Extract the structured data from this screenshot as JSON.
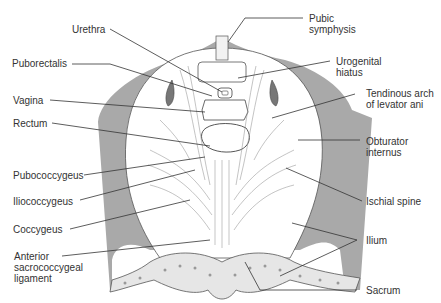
{
  "diagram": {
    "colors": {
      "bone": "#a9a9a9",
      "line": "#333333",
      "muscle_fill": "#ffffff",
      "sacrum_fill": "#e6e6e6"
    },
    "labels_left": [
      {
        "id": "urethra",
        "text": "Urethra"
      },
      {
        "id": "puborectalis",
        "text": "Puborectalis"
      },
      {
        "id": "vagina",
        "text": "Vagina"
      },
      {
        "id": "rectum",
        "text": "Rectum"
      },
      {
        "id": "pubococcygeus",
        "text": "Pubococcygeus"
      },
      {
        "id": "iliococcygeus",
        "text": "Iliococcygeus"
      },
      {
        "id": "coccygeus",
        "text": "Coccygeus"
      },
      {
        "id": "anterior-sacrococcygeal-ligament",
        "text": "Anterior\nsacrococcygeal\nligament"
      }
    ],
    "labels_right": [
      {
        "id": "pubic-symphysis",
        "text": "Pubic\nsymphysis"
      },
      {
        "id": "urogenital-hiatus",
        "text": "Urogenital\nhiatus"
      },
      {
        "id": "tendinous-arch",
        "text": "Tendinous arch\nof levator ani"
      },
      {
        "id": "obturator-internus",
        "text": "Obturator\ninternus"
      },
      {
        "id": "ischial-spine",
        "text": "Ischial spine"
      },
      {
        "id": "ilium",
        "text": "Ilium"
      },
      {
        "id": "sacrum",
        "text": "Sacrum"
      }
    ]
  }
}
